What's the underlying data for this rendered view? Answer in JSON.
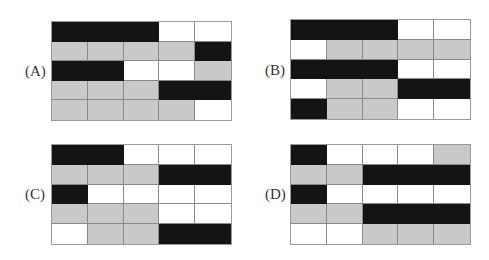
{
  "colors": {
    "black": "#141414",
    "gray": "#c9c9c9",
    "white": "#ffffff",
    "gridline": "#8a8a8a"
  },
  "legend": {
    "B": "black cell",
    "G": "gray cell",
    "W": "white cell"
  },
  "panels": [
    {
      "label": "(A)",
      "pos": {
        "left": 51,
        "top": 21,
        "width": 181,
        "height": 100,
        "label_left": 25,
        "label_top": 64
      },
      "rows": [
        [
          "B",
          "B",
          "B",
          "W",
          "W"
        ],
        [
          "G",
          "G",
          "G",
          "G",
          "B"
        ],
        [
          "B",
          "B",
          "W",
          "W",
          "G"
        ],
        [
          "G",
          "G",
          "G",
          "B",
          "B"
        ],
        [
          "G",
          "G",
          "G",
          "G",
          "W"
        ]
      ]
    },
    {
      "label": "(B)",
      "pos": {
        "left": 290,
        "top": 19,
        "width": 181,
        "height": 101,
        "label_left": 265,
        "label_top": 63
      },
      "rows": [
        [
          "B",
          "B",
          "B",
          "W",
          "W"
        ],
        [
          "W",
          "G",
          "G",
          "G",
          "G"
        ],
        [
          "B",
          "B",
          "B",
          "W",
          "W"
        ],
        [
          "W",
          "G",
          "G",
          "B",
          "B"
        ],
        [
          "B",
          "G",
          "G",
          "W",
          "W"
        ]
      ]
    },
    {
      "label": "(C)",
      "pos": {
        "left": 51,
        "top": 144,
        "width": 181,
        "height": 101,
        "label_left": 25,
        "label_top": 187
      },
      "rows": [
        [
          "B",
          "B",
          "W",
          "W",
          "W"
        ],
        [
          "G",
          "G",
          "G",
          "B",
          "B"
        ],
        [
          "B",
          "W",
          "W",
          "W",
          "W"
        ],
        [
          "G",
          "G",
          "G",
          "W",
          "W"
        ],
        [
          "W",
          "G",
          "G",
          "B",
          "B"
        ]
      ]
    },
    {
      "label": "(D)",
      "pos": {
        "left": 290,
        "top": 144,
        "width": 181,
        "height": 101,
        "label_left": 265,
        "label_top": 187
      },
      "rows": [
        [
          "B",
          "W",
          "W",
          "W",
          "G"
        ],
        [
          "G",
          "G",
          "B",
          "B",
          "B"
        ],
        [
          "B",
          "W",
          "W",
          "W",
          "W"
        ],
        [
          "G",
          "G",
          "B",
          "B",
          "B"
        ],
        [
          "W",
          "W",
          "G",
          "G",
          "G"
        ]
      ]
    }
  ]
}
